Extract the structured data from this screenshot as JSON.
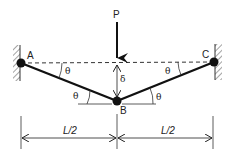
{
  "diagram": {
    "points": {
      "A": {
        "label": "A"
      },
      "B": {
        "label": "B"
      },
      "C": {
        "label": "C"
      }
    },
    "load": {
      "label": "P"
    },
    "deflection": {
      "label": "δ"
    },
    "angles": [
      {
        "label": "θ",
        "position": "at A, between dashed line and AB"
      },
      {
        "label": "θ",
        "position": "at B, left, between horizontal and BA"
      },
      {
        "label": "θ",
        "position": "at B, right, between horizontal and BC"
      },
      {
        "label": "θ",
        "position": "at C, between dashed line and CB"
      }
    ],
    "dimensions": [
      {
        "label": "L/2",
        "span": "A to B"
      },
      {
        "label": "L/2",
        "span": "B to C"
      }
    ],
    "colors": {
      "line": "#111111",
      "hatch": "#555555",
      "dashed": "#333333"
    }
  }
}
